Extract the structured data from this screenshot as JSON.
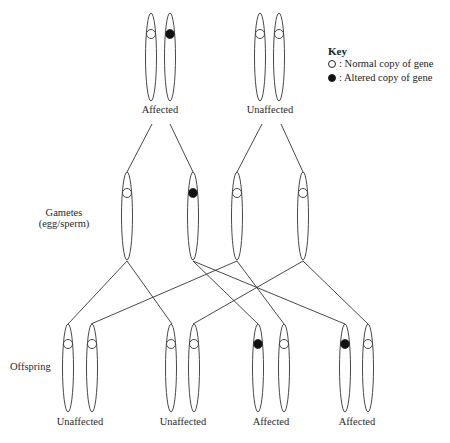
{
  "parents": {
    "left": {
      "label": "Affected",
      "chromosomes": [
        {
          "gene": "normal"
        },
        {
          "gene": "altered"
        }
      ]
    },
    "right": {
      "label": "Unaffected",
      "chromosomes": [
        {
          "gene": "normal"
        },
        {
          "gene": "normal"
        }
      ]
    }
  },
  "key": {
    "title": "Key",
    "items": [
      {
        "symbol": "open-circle",
        "label": ": Normal copy of gene"
      },
      {
        "symbol": "filled-circle",
        "label": ": Altered copy of gene"
      }
    ]
  },
  "gametes": {
    "label_line1": "Gametes",
    "label_line2": "(egg/sperm)",
    "items": [
      {
        "gene": "normal"
      },
      {
        "gene": "altered"
      },
      {
        "gene": "normal"
      },
      {
        "gene": "normal"
      }
    ]
  },
  "offspring": {
    "label": "Offspring",
    "items": [
      {
        "label": "Unaffected",
        "chromosomes": [
          {
            "gene": "normal"
          },
          {
            "gene": "normal"
          }
        ]
      },
      {
        "label": "Unaffected",
        "chromosomes": [
          {
            "gene": "normal"
          },
          {
            "gene": "normal"
          }
        ]
      },
      {
        "label": "Affected",
        "chromosomes": [
          {
            "gene": "altered"
          },
          {
            "gene": "normal"
          }
        ]
      },
      {
        "label": "Affected",
        "chromosomes": [
          {
            "gene": "altered"
          },
          {
            "gene": "normal"
          }
        ]
      }
    ]
  },
  "colors": {
    "line": "#333333",
    "fill_altered": "#111111",
    "background": "#ffffff"
  }
}
